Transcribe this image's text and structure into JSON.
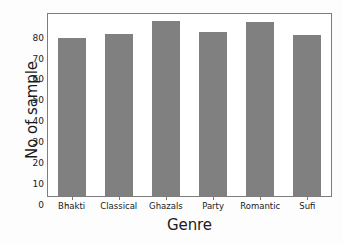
{
  "chart_data": {
    "type": "bar",
    "title": "",
    "xlabel": "Genre",
    "ylabel": "No of sample",
    "categories": [
      "Bhakti",
      "Classical",
      "Ghazals",
      "Party",
      "Romantic",
      "Sufi"
    ],
    "values": [
      75.6,
      77.5,
      83.5,
      78.3,
      83.0,
      77.0
    ],
    "ylim": [
      0,
      87
    ],
    "yticks": [
      0,
      10,
      20,
      30,
      40,
      50,
      60,
      70,
      80
    ],
    "ytick_labels": [
      "0",
      "10",
      "20",
      "30",
      "40",
      "50",
      "60",
      "70",
      "80"
    ],
    "grid": false,
    "legend": null,
    "bar_color": "#808080",
    "axes_color": "#7d7d7d",
    "text_color": "#1a1a1a",
    "background_color": "#fdfdfd",
    "plot_background_color": "#ffffff"
  }
}
